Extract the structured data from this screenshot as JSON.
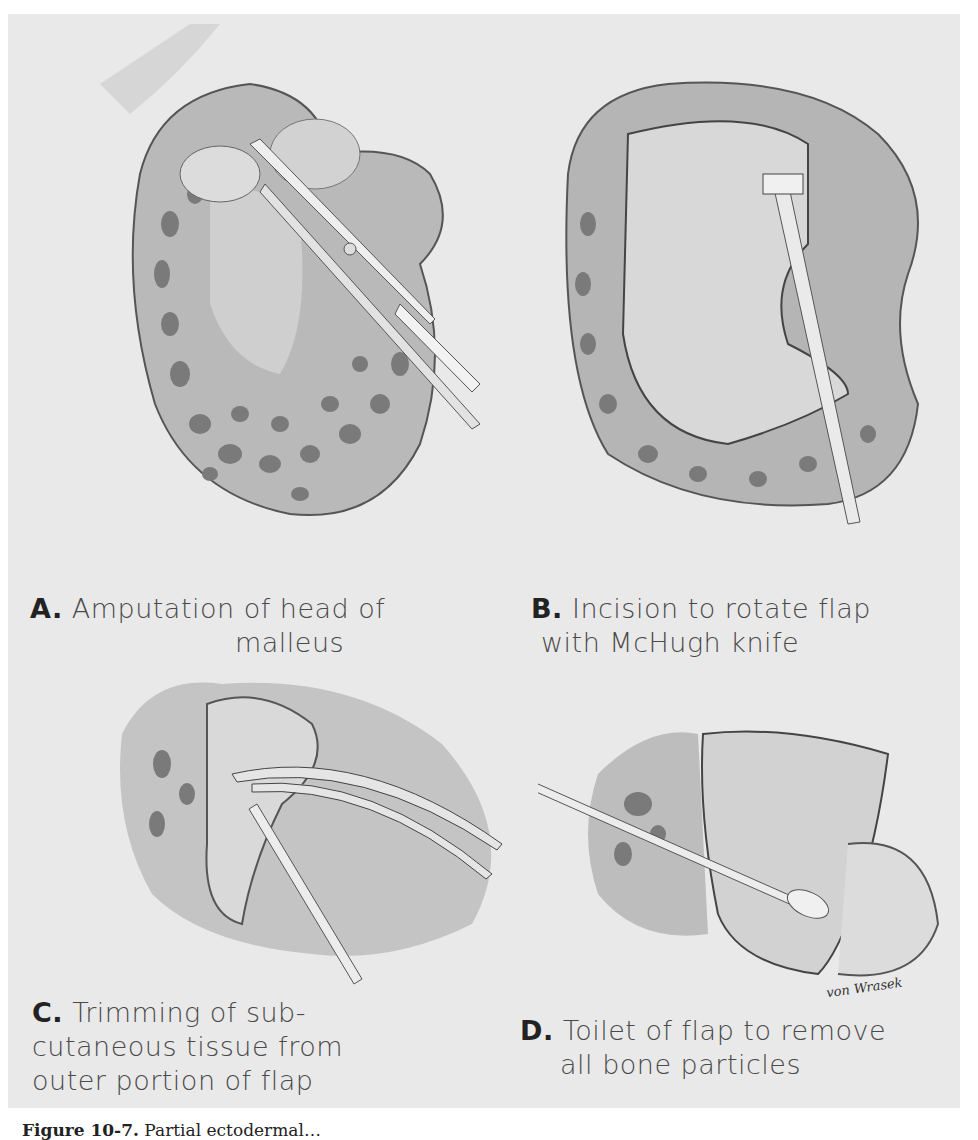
{
  "figure": {
    "panels": [
      {
        "letter": "A.",
        "line1": "Amputation of head of",
        "line2": "malleus"
      },
      {
        "letter": "B.",
        "line1": "Incision to rotate flap",
        "line2": "with McHugh knife"
      },
      {
        "letter": "C.",
        "line1": "Trimming of sub-",
        "line2": "cutaneous tissue from",
        "line3": "outer portion of flap"
      },
      {
        "letter": "D.",
        "line1": "Toilet of flap to remove",
        "line2": "all bone particles"
      }
    ],
    "signature": "von Wrasek",
    "caption": {
      "number": "Figure 10-7.",
      "text": "Partial ectodermal…"
    }
  },
  "colors": {
    "paper": "#e9e9e9",
    "ink": "#4a4a4a",
    "bone_spots": "#7a7a7a"
  }
}
